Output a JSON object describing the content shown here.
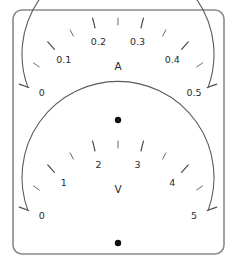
{
  "panel": {
    "name": "dual-analog-meter-faceplate",
    "background_color": "#ffffff",
    "frame_color": "#8a8a8a",
    "scale_color": "#5a5a60",
    "text_color": "#2b2b2b",
    "pivot_color": "#111111"
  },
  "gauges": [
    {
      "id": "ammeter",
      "unit_label": "A",
      "unit_name": "amperes",
      "min": 0,
      "max": 0.5,
      "tick_labels": [
        "0",
        "0.1",
        "0.2",
        "0.3",
        "0.4",
        "0.5"
      ],
      "tick_values": [
        0,
        0.1,
        0.2,
        0.3,
        0.4,
        0.5
      ],
      "minor_ticks_between": 1,
      "center": {
        "x": 118,
        "y": 120
      },
      "radius": 96,
      "start_angle_deg": 200,
      "end_angle_deg": 340,
      "pivot_dot": {
        "x": 118,
        "y": 120,
        "r": 3.2
      }
    },
    {
      "id": "voltmeter",
      "unit_label": "V",
      "unit_name": "volts",
      "min": 0,
      "max": 5,
      "tick_labels": [
        "0",
        "1",
        "2",
        "3",
        "4",
        "5"
      ],
      "tick_values": [
        0,
        1,
        2,
        3,
        4,
        5
      ],
      "minor_ticks_between": 1,
      "center": {
        "x": 118,
        "y": 243
      },
      "radius": 96,
      "start_angle_deg": 200,
      "end_angle_deg": 340,
      "pivot_dot": {
        "x": 118,
        "y": 243,
        "r": 3.2
      }
    }
  ],
  "frame": {
    "x": 13,
    "y": 10,
    "width": 211,
    "height": 244,
    "radius": 9
  }
}
